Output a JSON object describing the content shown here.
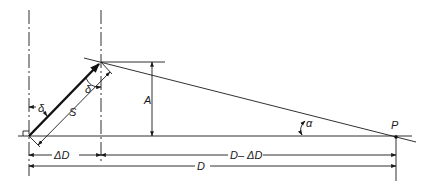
{
  "diagram": {
    "labels": {
      "delta_top": "δ",
      "delta_left": "δ",
      "slope": "S",
      "height": "A",
      "angle": "α",
      "point": "P",
      "offset": "ΔD",
      "remaining": "D– ΔD",
      "distance": "D"
    },
    "colors": {
      "ink": "#1a1a1a",
      "background": "#ffffff"
    }
  }
}
